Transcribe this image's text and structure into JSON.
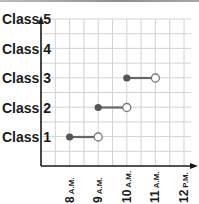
{
  "chart_data": {
    "type": "line",
    "subtype": "interval-segments",
    "title": "",
    "xlabel": "",
    "ylabel": "",
    "x_ticks": [
      {
        "num": "8",
        "suffix": "A.M."
      },
      {
        "num": "9",
        "suffix": "A.M."
      },
      {
        "num": "10",
        "suffix": "A.M."
      },
      {
        "num": "11",
        "suffix": "A.M."
      },
      {
        "num": "12",
        "suffix": "P.M."
      }
    ],
    "categories": [
      "Class 1",
      "Class 2",
      "Class 3",
      "Class 4",
      "Class 5"
    ],
    "y_labels": [
      "Class 5",
      "Class 4",
      "Class 3",
      "Class 2",
      "Class 1"
    ],
    "x_range_hours": [
      7,
      12.5
    ],
    "grid": true,
    "legend": "none",
    "series": [
      {
        "name": "Class 1",
        "start": 8,
        "end": 9,
        "start_closed": true,
        "end_closed": false
      },
      {
        "name": "Class 2",
        "start": 9,
        "end": 10,
        "start_closed": true,
        "end_closed": false
      },
      {
        "name": "Class 3",
        "start": 10,
        "end": 11,
        "start_closed": true,
        "end_closed": false
      }
    ]
  },
  "colors": {
    "axis": "#1a1a1a",
    "grid": "#d2d2d2",
    "segment": "#666666",
    "dot_fill": "#555555",
    "open_stroke": "#777777"
  }
}
